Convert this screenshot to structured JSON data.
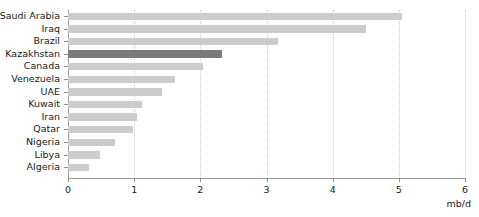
{
  "chart_data": {
    "type": "bar",
    "orientation": "horizontal",
    "title": "",
    "subtitle": "",
    "xlabel": "mb/d",
    "ylabel": "",
    "xlim": [
      0,
      6
    ],
    "xticks": [
      "0",
      "1",
      "2",
      "3",
      "4",
      "5",
      "6"
    ],
    "grid": "vertical-dotted",
    "legend": "none",
    "categories": [
      "Saudi Arabia",
      "Iraq",
      "Brazil",
      "Kazakhstan",
      "Canada",
      "Venezuela",
      "UAE",
      "Kuwait",
      "Iran",
      "Qatar",
      "Nigeria",
      "Libya",
      "Algeria"
    ],
    "values": [
      5.05,
      4.5,
      3.17,
      2.33,
      2.04,
      1.62,
      1.42,
      1.12,
      1.04,
      0.98,
      0.71,
      0.48,
      0.32
    ],
    "highlighted": [
      "Kazakhstan"
    ],
    "colors": {
      "bar": "#cccccc",
      "bar_highlight": "#7a7a7a",
      "axis": "#9a9a9a",
      "gridline": "#cfcfcf",
      "text": "#1a1a1a"
    }
  }
}
